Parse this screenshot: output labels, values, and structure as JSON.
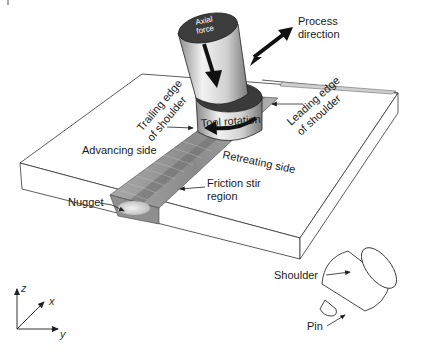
{
  "diagram": {
    "labels": {
      "axial_force_line1": "Axial",
      "axial_force_line2": "force",
      "process_direction_line1": "Process",
      "process_direction_line2": "direction",
      "tool_rotation": "Tool rotation",
      "trailing_edge_line1": "Trailing edge",
      "trailing_edge_line2": "of shoulder",
      "leading_edge_line1": "Leading edge",
      "leading_edge_line2": "of shoulder",
      "advancing_side": "Advancing side",
      "retreating_side": "Retreating side",
      "friction_stir_line1": "Friction stir",
      "friction_stir_line2": "region",
      "nugget": "Nugget",
      "shoulder": "Shoulder",
      "pin": "Pin"
    },
    "axes": {
      "z": "z",
      "x": "x",
      "y": "y"
    },
    "colors": {
      "tool_dark": "#3a3a3a",
      "tool_light": "#e6e6e6",
      "weld_band": "#9a9a9a",
      "weld_center": "#7d7d7d",
      "nugget": "#d8d8d8",
      "plate_edge": "#333333"
    }
  }
}
